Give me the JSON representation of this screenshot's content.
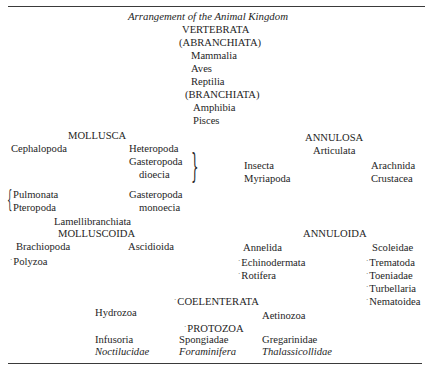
{
  "title": "Arrangement of the Animal Kingdom",
  "vertebrata": {
    "label": "VERTEBRATA",
    "abranchiata": "(ABRANCHIATA)",
    "abranchiata_items": [
      "Mammalia",
      "Aves",
      "Reptilia"
    ],
    "branchiata": "(BRANCHIATA)",
    "branchiata_items": [
      "Amphibia",
      "Pisces"
    ]
  },
  "mollusca": {
    "label": "MOLLUSCA",
    "items": [
      "Cephalopoda",
      "Heteropoda",
      "Gasteropoda",
      "dioecia",
      "Pulmonata",
      "Pteropoda",
      "Gasteropoda",
      "monoecia",
      "Lamellibranchiata"
    ]
  },
  "annulosa": {
    "label": "ANNULOSA",
    "sub": "Articulata",
    "items": [
      "Insecta",
      "Myriapoda",
      "Arachnida",
      "Crustacea"
    ]
  },
  "molluscoida": {
    "label": "MOLLUSCOIDA",
    "items": [
      "Brachiopoda",
      "Ascidioida",
      "Polyzoa"
    ]
  },
  "annuloida": {
    "label": "ANNULOIDA",
    "items": [
      "Annelida",
      "Echinodermata",
      "Rotifera",
      "Scoleidae",
      "Trematoda",
      "Toeniadae",
      "Turbellaria",
      "Nematoidea"
    ]
  },
  "coelenterata": {
    "label": "COELENTERATA",
    "items": [
      "Hydrozoa",
      "Aetinozoa"
    ]
  },
  "protozoa": {
    "label": "PROTOZOA",
    "items": [
      "Infusoria",
      "Noctilucidae",
      "Spongiadae",
      "Foraminifera",
      "Gregarinidae",
      "Thalassicollidae"
    ]
  },
  "marker": "·"
}
